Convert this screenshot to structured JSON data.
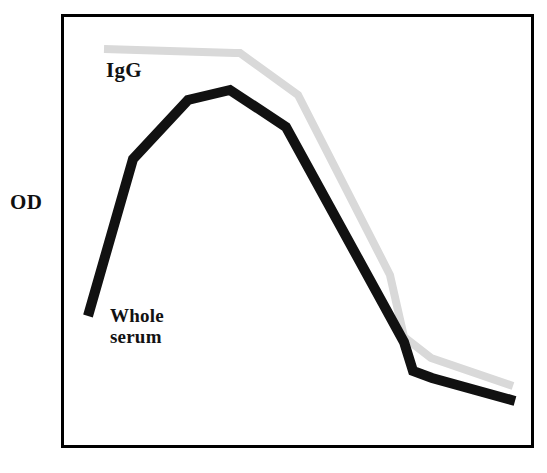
{
  "figure": {
    "background_color": "#ffffff",
    "frame_color": "#000000",
    "frame_width_px": 3
  },
  "labels": {
    "y_axis_title": "OD",
    "igg_label": "IgG",
    "whole_serum_label": "Whole\nserum"
  },
  "chart_data": {
    "type": "line",
    "title": "",
    "subtitle": "",
    "xlabel": "",
    "ylabel": "OD",
    "xlim": [
      0,
      10
    ],
    "ylim": [
      0,
      10
    ],
    "grid": false,
    "x_tick_labels": [],
    "y_tick_labels": [],
    "legend": "inline-annotations",
    "annotations": [
      {
        "text": "IgG",
        "x": 1.1,
        "y": 8.85,
        "color": "#111111"
      },
      {
        "text": "Whole serum",
        "x": 1.2,
        "y": 2.9,
        "color": "#111111"
      }
    ],
    "series": [
      {
        "name": "IgG",
        "color": "#d9d9d9",
        "line_width_px": 8,
        "x": [
          1.06,
          3.96,
          4.08,
          5.37,
          7.42,
          7.73,
          8.33,
          9.46
        ],
        "y": [
          9.63,
          9.53,
          9.53,
          8.59,
          5.05,
          4.03,
          3.56,
          3.25
        ],
        "points_px": [
          {
            "x": 104,
            "y": 49
          },
          {
            "x": 235,
            "y": 53
          },
          {
            "x": 240,
            "y": 53
          },
          {
            "x": 298,
            "y": 95
          },
          {
            "x": 390,
            "y": 275
          },
          {
            "x": 404,
            "y": 337
          },
          {
            "x": 431,
            "y": 358
          },
          {
            "x": 513,
            "y": 386
          }
        ]
      },
      {
        "name": "Whole serum",
        "color": "#111111",
        "line_width_px": 10,
        "x": [
          0.64,
          1.68,
          2.85,
          3.76,
          4.65,
          6.8,
          7.86,
          8.07,
          9.54
        ],
        "y": [
          3.11,
          6.67,
          8.05,
          8.6,
          8.3,
          4.69,
          2.97,
          2.68,
          2.03
        ],
        "points_px": [
          {
            "x": 88,
            "y": 316
          },
          {
            "x": 133,
            "y": 159
          },
          {
            "x": 188,
            "y": 100
          },
          {
            "x": 230,
            "y": 90
          },
          {
            "x": 286,
            "y": 127
          },
          {
            "x": 404,
            "y": 342
          },
          {
            "x": 413,
            "y": 371
          },
          {
            "x": 432,
            "y": 378
          },
          {
            "x": 515,
            "y": 401
          }
        ]
      }
    ],
    "plot_area_px": {
      "left": 61,
      "top": 14,
      "right": 534,
      "bottom": 448
    }
  }
}
